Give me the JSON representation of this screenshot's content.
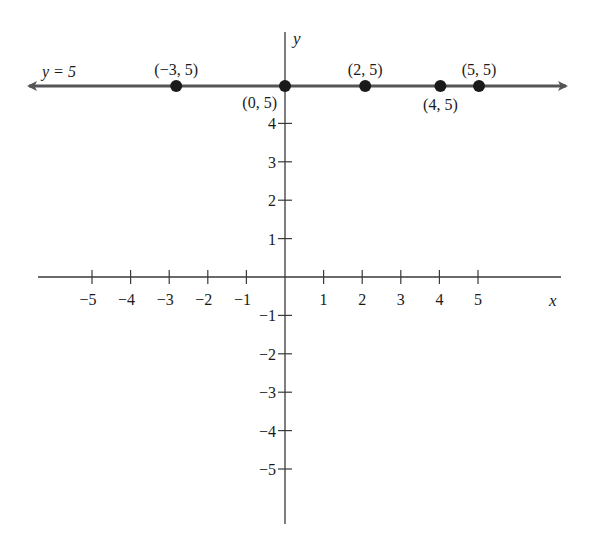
{
  "chart_data": {
    "type": "line",
    "title": "",
    "xlabel": "x",
    "ylabel": "y",
    "xlim": [
      -6.5,
      7.2
    ],
    "ylim": [
      -7.0,
      6.5
    ],
    "grid": false,
    "x_ticks": [
      -5,
      -4,
      -3,
      -2,
      -1,
      1,
      2,
      3,
      4,
      5
    ],
    "x_tick_labels": [
      "−5",
      "−4",
      "−3",
      "−2",
      "−1",
      "1",
      "2",
      "3",
      "4",
      "5"
    ],
    "y_ticks": [
      4,
      3,
      2,
      1,
      -1,
      -2,
      -3,
      -4,
      -5
    ],
    "y_tick_labels": [
      "4",
      "3",
      "2",
      "1",
      "−1",
      "−2",
      "−3",
      "−4",
      "−5"
    ],
    "series": [
      {
        "name": "y = 5",
        "kind": "horizontal-line-with-arrows",
        "y": 5,
        "label": "y = 5",
        "points": [
          {
            "x": -3,
            "y": 5,
            "label": "(−3, 5)",
            "label_pos": "above"
          },
          {
            "x": 0,
            "y": 5,
            "label": "(0, 5)",
            "label_pos": "below-left"
          },
          {
            "x": 2,
            "y": 5,
            "label": "(2, 5)",
            "label_pos": "above"
          },
          {
            "x": 4,
            "y": 5,
            "label": "(4, 5)",
            "label_pos": "below"
          },
          {
            "x": 5,
            "y": 5,
            "label": "(5, 5)",
            "label_pos": "above"
          }
        ]
      }
    ],
    "colors": {
      "ink": "#1a1a1a",
      "line": "#555555"
    }
  }
}
